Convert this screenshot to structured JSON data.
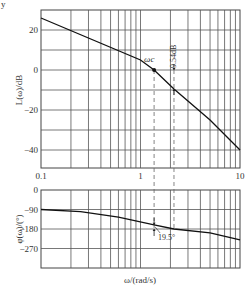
{
  "figure": {
    "corner_mark": "y",
    "xlabel": "ω/(rad/s)",
    "annotations": {
      "omega_c": "ωc",
      "gain_margin": "9.54dB",
      "phase_margin": "19.5°"
    }
  },
  "chart_data": [
    {
      "type": "line",
      "title": "",
      "name": "magnitude",
      "xlabel": "",
      "ylabel": "L(ω)/dB",
      "xscale": "log",
      "xlim": [
        0.1,
        10
      ],
      "ylim": [
        -49,
        30
      ],
      "xticks": [
        0.1,
        1,
        10
      ],
      "xtick_labels": [
        "0.1",
        "1",
        "10"
      ],
      "yticks": [
        20,
        0,
        -20,
        -40
      ],
      "ytick_labels": [
        "20",
        "0",
        "-20",
        "-40"
      ],
      "grid": true,
      "x": [
        0.1,
        1.0,
        1.37,
        2.17,
        5.0,
        10.0
      ],
      "values": [
        26,
        5,
        0,
        -9.54,
        -25,
        -40
      ],
      "markers": [
        {
          "x": 1.37,
          "y": 0,
          "label": "ωc"
        }
      ],
      "guides": [
        {
          "x": 1.37,
          "style": "dashed"
        },
        {
          "x": 2.17,
          "style": "dashed",
          "span_dB": [
            0,
            -9.54
          ],
          "label": "9.54dB"
        }
      ]
    },
    {
      "type": "line",
      "title": "",
      "name": "phase",
      "xlabel": "ω/(rad/s)",
      "ylabel": "φ(ω)/(°)",
      "xscale": "log",
      "xlim": [
        0.1,
        10
      ],
      "ylim": [
        -360,
        0
      ],
      "yticks": [
        0,
        -90,
        -180,
        -270
      ],
      "ytick_labels": [
        "0",
        "-90",
        "-180",
        "-270"
      ],
      "grid": true,
      "x": [
        0.1,
        0.25,
        0.6,
        1.37,
        2.17,
        5.0,
        10.0
      ],
      "values": [
        -90,
        -100,
        -125,
        -160.5,
        -180,
        -198,
        -230
      ],
      "annotations": [
        {
          "x": 1.37,
          "from": -160.5,
          "to": -180,
          "label": "19.5°"
        }
      ]
    }
  ]
}
